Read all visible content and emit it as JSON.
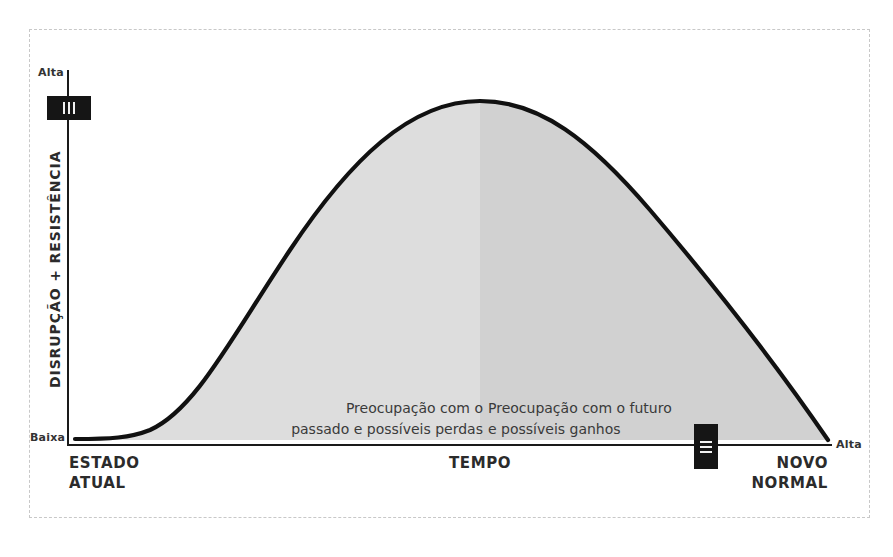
{
  "diagram": {
    "type": "change-curve",
    "y_axis": {
      "title": "DISRUPÇÃO + RESISTÊNCIA",
      "top_label": "Alta",
      "bottom_label": "Baixa"
    },
    "x_axis": {
      "title": "TEMPO",
      "start_label_line1": "ESTADO",
      "start_label_line2": "ATUAL",
      "end_label_line1": "NOVO",
      "end_label_line2": "NORMAL",
      "end_label": "Alta"
    },
    "regions": [
      {
        "name": "past",
        "line1": "Preocupação com o",
        "line2": "passado e possíveis perdas",
        "fill": "#dcdcdc"
      },
      {
        "name": "future",
        "line1": "Preocupação com o futuro",
        "line2": "e possíveis ganhos",
        "fill": "#d2d2d2"
      }
    ],
    "markers": [
      {
        "id": "III",
        "position": "y-axis near top",
        "orientation": "vertical bars"
      },
      {
        "id": "II",
        "position": "x-axis near end",
        "orientation": "horizontal bars"
      }
    ],
    "colors": {
      "line": "#111111",
      "axis": "#1a1a1a",
      "frame": "#c8c8c8",
      "marker": "#151515"
    }
  }
}
